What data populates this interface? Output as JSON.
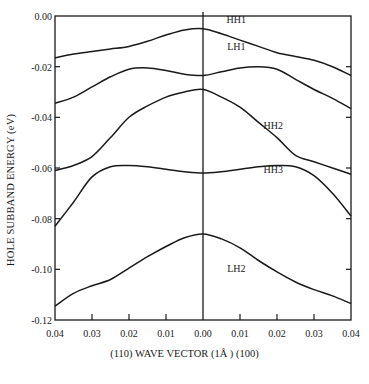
{
  "chart_data": {
    "type": "line",
    "title": "",
    "xlabel": "(110) WAVE VECTOR (1Å ) (100)",
    "ylabel": "HOLE SUBBAND ENERGY (eV)",
    "x_tick_labels": [
      "0.04",
      "0.03",
      "0.02",
      "0.01",
      "0.00",
      "0.01",
      "0.02",
      "0.03",
      "0.04"
    ],
    "y_tick_labels": [
      "0.00",
      "-0.02",
      "-0.04",
      "-0.06",
      "-0.08",
      "-0.10",
      "-0.12"
    ],
    "xlim": [
      -0.04,
      0.04
    ],
    "ylim": [
      -0.12,
      0.0
    ],
    "x_note": "Negative x is (110) direction, positive x is (100) direction; both plotted as magnitudes",
    "grid": false,
    "legend": "inline labels",
    "x": [
      -0.04,
      -0.035,
      -0.03,
      -0.025,
      -0.02,
      -0.015,
      -0.01,
      -0.005,
      0.0,
      0.005,
      0.01,
      0.015,
      0.02,
      0.025,
      0.03,
      0.035,
      0.04
    ],
    "series": [
      {
        "name": "HH1",
        "label_pos": [
          0.009,
          -0.001
        ],
        "values": [
          -0.0165,
          -0.015,
          -0.014,
          -0.013,
          -0.012,
          -0.01,
          -0.0075,
          -0.0055,
          -0.005,
          -0.007,
          -0.0095,
          -0.012,
          -0.0145,
          -0.016,
          -0.0175,
          -0.02,
          -0.0235
        ]
      },
      {
        "name": "LH1",
        "label_pos": [
          0.009,
          -0.012
        ],
        "values": [
          -0.0345,
          -0.032,
          -0.028,
          -0.024,
          -0.021,
          -0.0205,
          -0.0215,
          -0.023,
          -0.0235,
          -0.022,
          -0.0205,
          -0.02,
          -0.021,
          -0.025,
          -0.029,
          -0.0325,
          -0.0365
        ]
      },
      {
        "name": "HH2",
        "label_pos": [
          0.019,
          -0.043
        ],
        "values": [
          -0.061,
          -0.059,
          -0.0555,
          -0.048,
          -0.04,
          -0.0355,
          -0.032,
          -0.03,
          -0.029,
          -0.032,
          -0.036,
          -0.042,
          -0.048,
          -0.055,
          -0.0575,
          -0.06,
          -0.0625
        ]
      },
      {
        "name": "HH3",
        "label_pos": [
          0.019,
          -0.0605
        ],
        "values": [
          -0.083,
          -0.0735,
          -0.0635,
          -0.0595,
          -0.059,
          -0.0595,
          -0.0605,
          -0.0615,
          -0.062,
          -0.0615,
          -0.0605,
          -0.0595,
          -0.059,
          -0.0595,
          -0.063,
          -0.07,
          -0.079
        ]
      },
      {
        "name": "LH2",
        "label_pos": [
          0.009,
          -0.0995
        ],
        "values": [
          -0.1145,
          -0.1095,
          -0.1065,
          -0.104,
          -0.0995,
          -0.095,
          -0.091,
          -0.0875,
          -0.086,
          -0.088,
          -0.0915,
          -0.0965,
          -0.101,
          -0.105,
          -0.108,
          -0.1105,
          -0.1135
        ]
      }
    ]
  }
}
